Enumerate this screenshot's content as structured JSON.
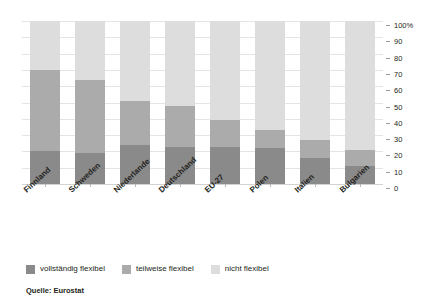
{
  "chart_data": {
    "type": "bar",
    "stacked": true,
    "orientation": "vertical",
    "title": "",
    "subtitle": "",
    "xlabel": "",
    "ylabel": "",
    "ylim": [
      0,
      100
    ],
    "yticks": [
      0,
      10,
      20,
      30,
      40,
      50,
      60,
      70,
      80,
      90,
      100
    ],
    "ytick_labels": [
      "0",
      "10",
      "20",
      "30",
      "40",
      "50",
      "60",
      "70",
      "80",
      "90",
      "100%"
    ],
    "grid": true,
    "grid_axis": "y",
    "legend_position": "bottom-left",
    "categories": [
      "Finnland",
      "Schweden",
      "Niederlande",
      "Deutschland",
      "EU-27",
      "Polen",
      "Italien",
      "Bulgarien"
    ],
    "series": [
      {
        "name": "vollständig flexibel",
        "color": "#8a8a8a",
        "values": [
          20,
          19,
          24,
          23,
          23,
          22,
          16,
          11
        ]
      },
      {
        "name": "teilweise flexibel",
        "color": "#ababab",
        "values": [
          50,
          45,
          27,
          25,
          16,
          11,
          11,
          10
        ]
      },
      {
        "name": "nicht flexibel",
        "color": "#dddddd",
        "values": [
          30,
          36,
          49,
          52,
          61,
          67,
          73,
          79
        ]
      }
    ],
    "source": "Quelle: Eurostat"
  },
  "legend": {
    "items": [
      {
        "label": "vollständig flexibel",
        "color": "#8a8a8a"
      },
      {
        "label": "teilweise flexibel",
        "color": "#ababab"
      },
      {
        "label": "nicht flexibel",
        "color": "#dddddd"
      }
    ]
  },
  "footer": {
    "source": "Quelle: Eurostat"
  }
}
